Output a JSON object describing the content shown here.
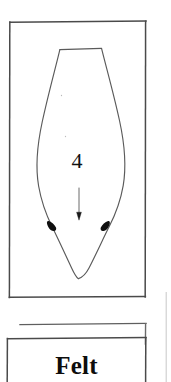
{
  "page": {
    "background_color": "#ffffff",
    "ink_color": "#3a3a3a",
    "dark_ink_color": "#0d0d0d"
  },
  "pattern_panel": {
    "name": "pattern-piece-panel",
    "frame": {
      "x": 9,
      "y": 21,
      "width": 137,
      "height": 277
    },
    "piece": {
      "number_label": "4",
      "grainline_arrow": "downward-arrow",
      "notches": 2,
      "shape": "elongated-leaf-pattern-piece"
    }
  },
  "caption_panel": {
    "name": "caption-panel",
    "rule_line": {
      "x1": 20,
      "y1": 324,
      "x2": 146,
      "y2": 324
    },
    "frame": {
      "x": 7,
      "y": 338,
      "width": 139,
      "height": 44
    },
    "title": "Felt"
  },
  "right_margin_rule": {
    "name": "page-edge-rule",
    "x": 166,
    "y1": 292,
    "y2": 382
  }
}
